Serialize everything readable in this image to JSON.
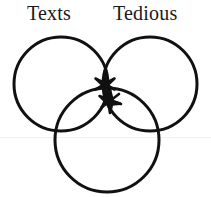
{
  "diagram": {
    "type": "venn",
    "title_labels": [
      {
        "name": "texts",
        "text": "Texts"
      },
      {
        "name": "tedious",
        "text": "Tedious"
      }
    ],
    "background_color": "#ffffff",
    "stroke_color": "#111111",
    "stroke_width": 3,
    "circles": [
      {
        "name": "left-circle",
        "label": "Texts",
        "cx": 61,
        "cy": 84,
        "r": 47
      },
      {
        "name": "right-circle",
        "label": "Tedious",
        "cx": 150,
        "cy": 84,
        "r": 47
      },
      {
        "name": "bottom-circle",
        "label": "",
        "cx": 107,
        "cy": 140,
        "r": 52
      }
    ],
    "marks": [
      {
        "name": "star-upper",
        "shape": "asterisk-star",
        "points": 6,
        "cx": 105,
        "cy": 84,
        "r": 11
      },
      {
        "name": "star-lower",
        "shape": "five-point-star",
        "points": 5,
        "cx": 110,
        "cy": 101,
        "r": 12
      }
    ],
    "artifacts": [
      {
        "name": "scan-line",
        "color": "#f0f0f0",
        "y": 137
      }
    ]
  }
}
